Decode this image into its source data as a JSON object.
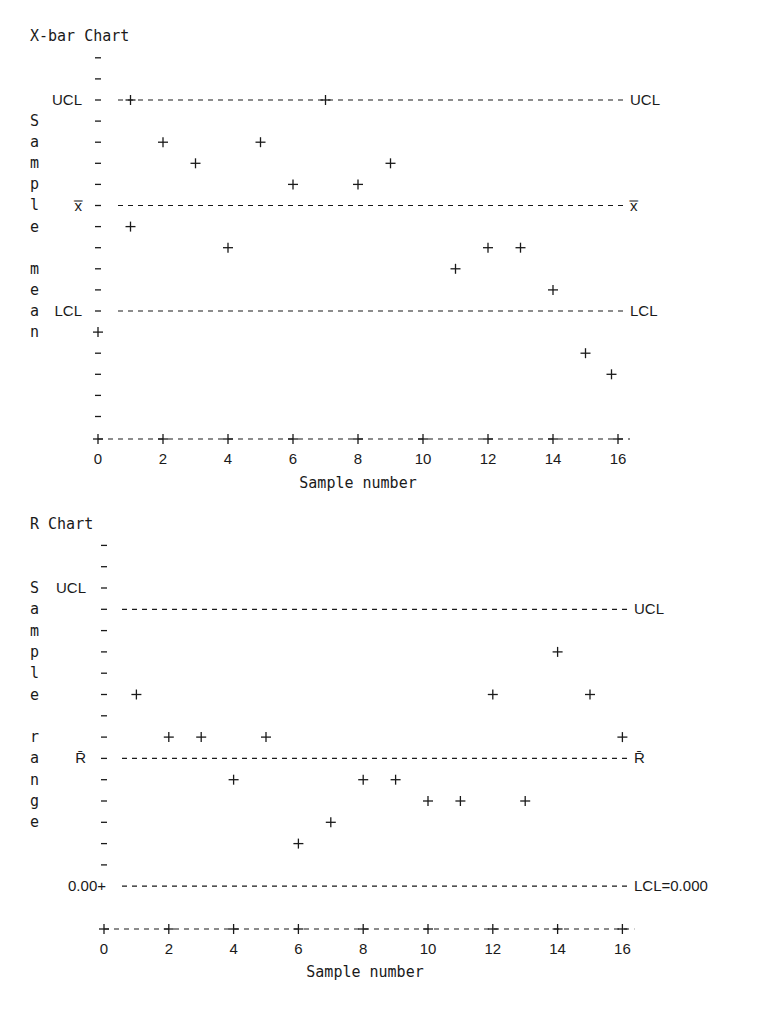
{
  "chart_data": [
    {
      "type": "scatter",
      "title": "X-bar Chart",
      "xlabel": "Sample number",
      "ylabel": "Sample mean",
      "x_ticks": [
        0,
        2,
        4,
        6,
        8,
        10,
        12,
        14,
        16
      ],
      "xlim": [
        0,
        16.5
      ],
      "control_lines": [
        {
          "name": "UCL",
          "level": 0,
          "left_label": "UCL",
          "right_label": "UCL"
        },
        {
          "name": "center",
          "level": 5,
          "left_label": "x̿",
          "right_label": "x̿"
        },
        {
          "name": "LCL",
          "level": 10,
          "left_label": "LCL",
          "right_label": "LCL"
        }
      ],
      "y_levels_note": "relative row levels from top (UCL=0, centerline=5, LCL=10); larger = lower value",
      "rows_above_ucl": 2,
      "rows_below": 5,
      "points": [
        {
          "sample": 0,
          "level": 11
        },
        {
          "sample": 1,
          "level": 0
        },
        {
          "sample": 1,
          "level": 6
        },
        {
          "sample": 2,
          "level": 2
        },
        {
          "sample": 3,
          "level": 3
        },
        {
          "sample": 4,
          "level": 7
        },
        {
          "sample": 5,
          "level": 2
        },
        {
          "sample": 6,
          "level": 4
        },
        {
          "sample": 7,
          "level": 0
        },
        {
          "sample": 8,
          "level": 4
        },
        {
          "sample": 9,
          "level": 3
        },
        {
          "sample": 11,
          "level": 8
        },
        {
          "sample": 12,
          "level": 7
        },
        {
          "sample": 13,
          "level": 7
        },
        {
          "sample": 14,
          "level": 9
        },
        {
          "sample": 15,
          "level": 12
        },
        {
          "sample": 15.8,
          "level": 13
        }
      ]
    },
    {
      "type": "scatter",
      "title": "R Chart",
      "xlabel": "Sample number",
      "ylabel": "Sample range",
      "x_ticks": [
        0,
        2,
        4,
        6,
        8,
        10,
        12,
        14,
        16
      ],
      "xlim": [
        0,
        16.5
      ],
      "control_lines": [
        {
          "name": "UCL",
          "level": 1,
          "left_label": "UCL",
          "right_label": "UCL"
        },
        {
          "name": "center",
          "level": 8,
          "left_label": "R̄",
          "right_label": "R̄"
        },
        {
          "name": "LCL",
          "level": 14,
          "left_label": "0.00+",
          "right_label": "LCL=0.000"
        }
      ],
      "left_ucl_label_level": 0,
      "y_levels_note": "relative row levels from top (UCL label row=0); larger = lower value; LCL = 0.000",
      "rows_above_ucl": 2,
      "points": [
        {
          "sample": 1,
          "level": 5
        },
        {
          "sample": 2,
          "level": 7
        },
        {
          "sample": 3,
          "level": 7
        },
        {
          "sample": 4,
          "level": 9
        },
        {
          "sample": 5,
          "level": 7
        },
        {
          "sample": 6,
          "level": 12
        },
        {
          "sample": 7,
          "level": 11
        },
        {
          "sample": 8,
          "level": 9
        },
        {
          "sample": 9,
          "level": 9
        },
        {
          "sample": 10,
          "level": 10
        },
        {
          "sample": 11,
          "level": 10
        },
        {
          "sample": 12,
          "level": 5
        },
        {
          "sample": 13,
          "level": 10
        },
        {
          "sample": 14,
          "level": 3
        },
        {
          "sample": 15,
          "level": 5
        },
        {
          "sample": 16,
          "level": 7
        }
      ]
    }
  ],
  "labels": {
    "xbar_title": "X-bar Chart",
    "r_title": "R Chart",
    "xbar_ylabel": "Sample mean",
    "r_ylabel": "Sample range",
    "xlabel": "Sample number"
  }
}
